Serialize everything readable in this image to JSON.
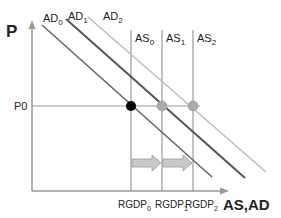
{
  "diagram": {
    "y_axis_label": "P",
    "x_axis_label": "AS,AD",
    "price_level_label": "P0",
    "ad_curves": [
      {
        "base": "AD",
        "sub": "0",
        "color": "#666666"
      },
      {
        "base": "AD",
        "sub": "1",
        "color": "#555555"
      },
      {
        "base": "AD",
        "sub": "2",
        "color": "#bbbbbb"
      }
    ],
    "as_curves": [
      {
        "base": "AS",
        "sub": "0"
      },
      {
        "base": "AS",
        "sub": "1"
      },
      {
        "base": "AS",
        "sub": "2"
      }
    ],
    "x_ticks": [
      {
        "base": "RGDP",
        "sub": "0"
      },
      {
        "base": "RGDP",
        "sub": "1"
      },
      {
        "base": "RGDP",
        "sub": "2"
      }
    ],
    "equilibrium_points": [
      {
        "label": "AS0/AD0",
        "color": "#000000"
      },
      {
        "label": "AS1/AD1",
        "color": "#aaaaaa"
      },
      {
        "label": "AS2/AD2",
        "color": "#aaaaaa"
      }
    ],
    "shift_arrows": [
      {
        "from": "RGDP0",
        "to": "RGDP1"
      },
      {
        "from": "RGDP1",
        "to": "RGDP2"
      }
    ],
    "colors": {
      "axis": "#999999",
      "arrow_fill": "#c8c8c8",
      "arrow_stroke": "#9a9a9a"
    }
  }
}
